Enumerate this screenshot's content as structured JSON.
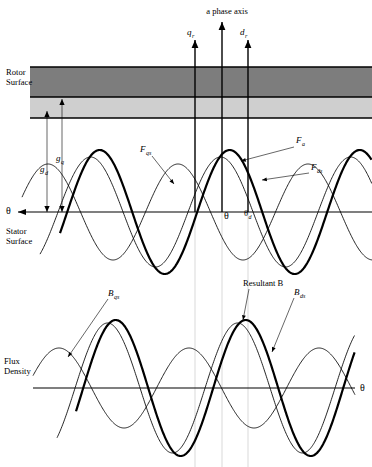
{
  "figure": {
    "title": "a phase axis",
    "axis_arrows": [
      {
        "name": "q-axis",
        "label": "q",
        "sub": "r",
        "x": 195
      },
      {
        "name": "a-phase-axis",
        "label": "",
        "sub": "",
        "x": 222
      },
      {
        "name": "d-axis",
        "label": "d",
        "sub": "r",
        "x": 248
      }
    ],
    "rotor": {
      "label_line1": "Rotor",
      "label_line2": "Surface",
      "dark_band_color": "#7d7d7d",
      "light_band_color": "#cfcfcf"
    },
    "stator": {
      "label_line1": "Stator",
      "label_line2": "Surface"
    },
    "gaps": [
      {
        "name": "gap-d",
        "label": "g",
        "sub": "d",
        "x": 47,
        "top": 111,
        "text_x": 40,
        "text_y": 172
      },
      {
        "name": "gap-q",
        "label": "g",
        "sub": "q",
        "x": 62,
        "top": 99,
        "text_x": 56,
        "text_y": 161
      }
    ],
    "mmf_labels": [
      {
        "name": "mmf-qs",
        "label": "F",
        "sub": "qs",
        "text_x": 140,
        "text_y": 152,
        "lead_x1": 152,
        "lead_y1": 156,
        "lead_x2": 174,
        "lead_y2": 184
      },
      {
        "name": "mmf-a",
        "label": "F",
        "sub": "a",
        "text_x": 296,
        "text_y": 143,
        "lead_x1": 294,
        "lead_y1": 147,
        "lead_x2": 241,
        "lead_y2": 161
      },
      {
        "name": "mmf-ds",
        "label": "F",
        "sub": "ds",
        "text_x": 311,
        "text_y": 170,
        "lead_x1": 309,
        "lead_y1": 173,
        "lead_x2": 262,
        "lead_y2": 180
      }
    ],
    "angle_labels": [
      {
        "name": "theta-left-upper",
        "label": "θ",
        "sub": "",
        "x": 6,
        "y": 214
      },
      {
        "name": "theta-center",
        "label": "θ",
        "sub": "",
        "x": 224,
        "y": 219
      },
      {
        "name": "theta-d",
        "label": "θ",
        "sub": "d",
        "x": 244,
        "y": 216
      },
      {
        "name": "theta-lower-right",
        "label": "θ",
        "sub": "",
        "x": 360,
        "y": 391
      }
    ],
    "flux": {
      "label_line1": "Flux",
      "label_line2": "Density",
      "labels": [
        {
          "name": "flux-qs",
          "label": "B",
          "sub": "qs",
          "text_x": 108,
          "text_y": 296,
          "lead_x1": 108,
          "lead_y1": 299,
          "lead_x2": 68,
          "lead_y2": 357
        },
        {
          "name": "resultant-b",
          "label": "Resultant B",
          "sub": "",
          "text_x": 243,
          "text_y": 286,
          "lead_x1": 249,
          "lead_y1": 289,
          "lead_x2": 243,
          "lead_y2": 320
        },
        {
          "name": "flux-ds",
          "label": "B",
          "sub": "ds",
          "text_x": 294,
          "text_y": 295,
          "lead_x1": 294,
          "lead_y1": 298,
          "lead_x2": 272,
          "lead_y2": 352
        }
      ]
    }
  },
  "chart_data": [
    {
      "type": "line",
      "name": "mmf-chart",
      "title": "MMF waves referred to a phase axis",
      "xlabel": "θ",
      "ylabel": "MMF",
      "axis_y": 212,
      "x_start": 18,
      "x_end": 372,
      "grid": false,
      "legend_position": "inline-annotations",
      "series": [
        {
          "name": "F_qs",
          "style": "thin",
          "amplitude": 48,
          "period": 130,
          "phase_deg": 18,
          "x_start": 22,
          "x_end": 372
        },
        {
          "name": "F_a",
          "style": "thick",
          "amplitude": 62,
          "period": 130,
          "phase_deg": -20,
          "x_start": 60,
          "x_end": 372
        },
        {
          "name": "F_ds",
          "style": "thin",
          "amplitude": 55,
          "period": 130,
          "phase_deg": -50,
          "x_start": 40,
          "x_end": 372
        }
      ]
    },
    {
      "type": "line",
      "name": "flux-density-chart",
      "title": "Resultant flux density",
      "xlabel": "θ",
      "ylabel": "Flux Density",
      "axis_y": 388,
      "x_start": 33,
      "x_end": 355,
      "grid": false,
      "legend_position": "inline-annotations",
      "series": [
        {
          "name": "B_qs",
          "style": "thin",
          "amplitude": 40,
          "period": 130,
          "phase_deg": 18,
          "x_start": 33,
          "x_end": 355
        },
        {
          "name": "Resultant_B",
          "style": "thick",
          "amplitude": 68,
          "period": 130,
          "phase_deg": -20,
          "x_start": 76,
          "x_end": 355
        },
        {
          "name": "B_ds",
          "style": "thin",
          "amplitude": 65,
          "period": 130,
          "phase_deg": -50,
          "x_start": 57,
          "x_end": 355
        }
      ]
    }
  ],
  "reference_lines": [
    {
      "name": "ref-q",
      "x": 195,
      "y1": 212,
      "y2": 467
    },
    {
      "name": "ref-a",
      "x": 222,
      "y1": 212,
      "y2": 467
    },
    {
      "name": "ref-d",
      "x": 248,
      "y1": 212,
      "y2": 467
    }
  ]
}
